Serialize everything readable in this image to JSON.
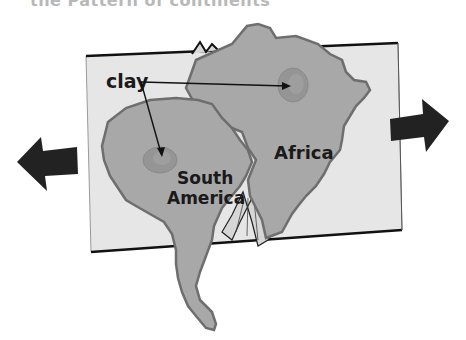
{
  "title": "the Pattern of continents",
  "labels": {
    "clay": "clay",
    "africa": "Africa",
    "south_america_line1": "South",
    "south_america_line2": "America"
  },
  "colors": {
    "page": "#e6e6e6",
    "continent": "#a8a8a8",
    "continent_edge": "#6e6e6e",
    "clay_spot": "#959595",
    "arrow": "#222222"
  },
  "arrows": [
    {
      "name": "left-arrow",
      "direction": "left"
    },
    {
      "name": "right-arrow",
      "direction": "right"
    }
  ]
}
